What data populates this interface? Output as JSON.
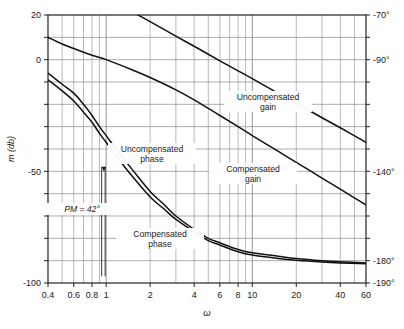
{
  "chart_data": {
    "type": "line",
    "title": "",
    "subtitle": "",
    "xlabel": "ω",
    "ylabel": "m (db)",
    "ylabel_right": "phase (degrees)",
    "xscale": "log",
    "xlim": [
      0.4,
      60
    ],
    "ylim": [
      -100,
      20
    ],
    "ylim_right": [
      -190,
      -70
    ],
    "grid": true,
    "legend": "inline-annotations",
    "xticks": [
      "0.4",
      "0.6",
      "0.8",
      "1",
      "2",
      "4",
      "6",
      "8",
      "10",
      "20",
      "40",
      "60"
    ],
    "xtick_values": [
      0.4,
      0.6,
      0.8,
      1,
      2,
      4,
      6,
      8,
      10,
      20,
      40,
      60
    ],
    "yticks_left": [
      "20",
      "0",
      "-50",
      "-100"
    ],
    "ytick_values_left": [
      20,
      0,
      -50,
      -100
    ],
    "yticks_right": [
      "-70°",
      "-90°",
      "-140°",
      "-180°",
      "-190°"
    ],
    "ytick_values_right": [
      -70,
      -90,
      -140,
      -180,
      -190
    ],
    "series": [
      {
        "name": "Uncompensated gain",
        "axis": "left",
        "points": [
          [
            0.4,
            44
          ],
          [
            0.5,
            40
          ],
          [
            0.6,
            36.5
          ],
          [
            0.8,
            31.5
          ],
          [
            1.0,
            28
          ],
          [
            1.5,
            21.5
          ],
          [
            2.0,
            17
          ],
          [
            3.0,
            10.5
          ],
          [
            4.0,
            6
          ],
          [
            6.0,
            -0.5
          ],
          [
            8.0,
            -5
          ],
          [
            10.0,
            -8.5
          ],
          [
            15.0,
            -15
          ],
          [
            20.0,
            -19.5
          ],
          [
            30.0,
            -26
          ],
          [
            40.0,
            -30.5
          ],
          [
            60.0,
            -37
          ]
        ]
      },
      {
        "name": "Compensated gain",
        "axis": "left",
        "points": [
          [
            0.4,
            10
          ],
          [
            0.5,
            7
          ],
          [
            0.6,
            5
          ],
          [
            0.8,
            2
          ],
          [
            1.0,
            0
          ],
          [
            1.5,
            -4.5
          ],
          [
            2.0,
            -8
          ],
          [
            3.0,
            -13.5
          ],
          [
            4.0,
            -18
          ],
          [
            6.0,
            -25
          ],
          [
            8.0,
            -30
          ],
          [
            10.0,
            -34
          ],
          [
            15.0,
            -41
          ],
          [
            20.0,
            -46
          ],
          [
            30.0,
            -53
          ],
          [
            40.0,
            -58
          ],
          [
            60.0,
            -65
          ]
        ]
      },
      {
        "name": "Uncompensated phase",
        "axis": "right",
        "points": [
          [
            0.4,
            -96
          ],
          [
            0.5,
            -101
          ],
          [
            0.6,
            -105
          ],
          [
            0.7,
            -110
          ],
          [
            0.8,
            -115
          ],
          [
            0.9,
            -120
          ],
          [
            1.0,
            -124
          ],
          [
            1.2,
            -131
          ],
          [
            1.5,
            -139
          ],
          [
            2.0,
            -149
          ],
          [
            2.5,
            -155
          ],
          [
            3.0,
            -160
          ],
          [
            4.0,
            -166
          ],
          [
            5.0,
            -170
          ],
          [
            6.0,
            -172
          ],
          [
            8.0,
            -175
          ],
          [
            10.0,
            -176.5
          ],
          [
            15.0,
            -178
          ],
          [
            20.0,
            -179
          ],
          [
            30.0,
            -180
          ],
          [
            40.0,
            -180.5
          ],
          [
            60.0,
            -181
          ]
        ]
      },
      {
        "name": "Compensated phase",
        "axis": "right",
        "points": [
          [
            0.4,
            -99
          ],
          [
            0.5,
            -104
          ],
          [
            0.6,
            -108.5
          ],
          [
            0.7,
            -113.5
          ],
          [
            0.8,
            -118
          ],
          [
            0.9,
            -123
          ],
          [
            1.0,
            -127
          ],
          [
            1.2,
            -134
          ],
          [
            1.5,
            -142
          ],
          [
            2.0,
            -151.5
          ],
          [
            2.5,
            -157
          ],
          [
            3.0,
            -161.5
          ],
          [
            4.0,
            -167
          ],
          [
            5.0,
            -171
          ],
          [
            6.0,
            -173
          ],
          [
            8.0,
            -176
          ],
          [
            10.0,
            -177.5
          ],
          [
            15.0,
            -179
          ],
          [
            20.0,
            -179.8
          ],
          [
            30.0,
            -180.6
          ],
          [
            40.0,
            -181
          ],
          [
            60.0,
            -181.4
          ]
        ]
      }
    ],
    "annotations": [
      {
        "id": "uncompensated-gain-label",
        "text_line1": "Uncompensated",
        "text_line2": "gain",
        "x": 268,
        "y": 100
      },
      {
        "id": "compensated-gain-label",
        "text_line1": "Compensated",
        "text_line2": "gain",
        "x": 253,
        "y": 172
      },
      {
        "id": "uncompensated-phase-label",
        "text_line1": "Uncompensated",
        "text_line2": "phase",
        "x": 152,
        "y": 152
      },
      {
        "id": "compensated-phase-label",
        "text_line1": "Compensated",
        "text_line2": "phase",
        "x": 160,
        "y": 237
      },
      {
        "id": "phase-margin-label",
        "text_line1": "PM = 42°",
        "text_line2": "",
        "x": 82,
        "y": 212
      }
    ],
    "markers": {
      "phase_margin_crossover": {
        "omega": 1.0,
        "label": "PM = 42°",
        "value_deg": 42
      }
    },
    "colors": {
      "curve": "#111111",
      "grid": "#8a8a8a",
      "axis": "#222222",
      "background": "#ffffff",
      "text": "#1a1a1a"
    }
  }
}
